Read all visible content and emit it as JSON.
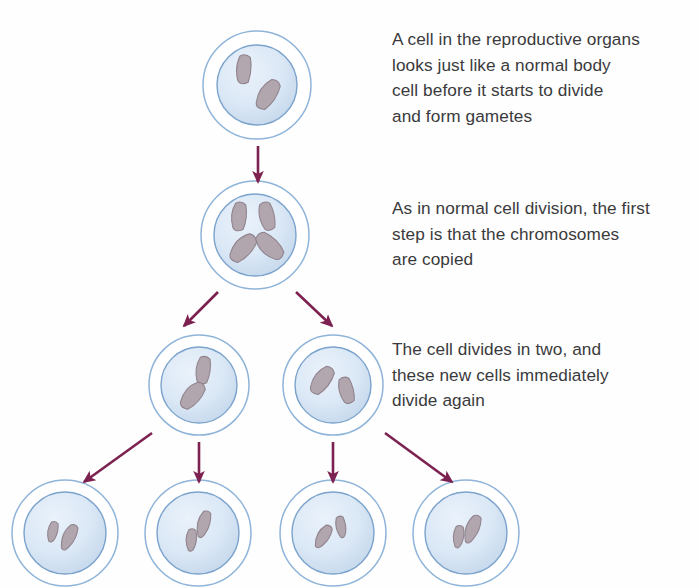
{
  "diagram": {
    "background_color": "#fefefe",
    "palette": {
      "membrane_stroke": "#8fb4d9",
      "nucleus_stroke": "#7ba3cc",
      "nucleus_fill_light": "#e2edf8",
      "nucleus_fill_dark": "#c4d8ec",
      "chromosome_fill": "#b0a3ab",
      "chromosome_stroke": "#8d7f89",
      "arrow_color": "#7c2150",
      "text_color": "#3a3a3c"
    },
    "captions": [
      {
        "id": "caption-0",
        "stage": "interphase",
        "text": "A cell in the reproductive organs\nlooks just like a normal body\ncell before it starts to divide\nand form gametes"
      },
      {
        "id": "caption-1",
        "stage": "chromosome-replication",
        "text": "As in normal cell division, the first\nstep is that the chromosomes\nare copied"
      },
      {
        "id": "caption-2",
        "stage": "two-divisions",
        "text": "The cell divides in two, and\nthese new cells immediately\ndivide again"
      }
    ],
    "rows": [
      {
        "row": 1,
        "name": "parent-cell",
        "cells": [
          {
            "id": "cell-parent",
            "cx": 257,
            "cy": 85,
            "r_outer": 54,
            "r_nucleus": 40,
            "chromosomes": 2
          }
        ]
      },
      {
        "row": 2,
        "name": "replicated-cell",
        "cells": [
          {
            "id": "cell-replicated",
            "cx": 255,
            "cy": 235,
            "r_outer": 54,
            "r_nucleus": 41,
            "chromosomes": 4
          }
        ]
      },
      {
        "row": 3,
        "name": "daughter-cells",
        "cells": [
          {
            "id": "cell-daughter-left",
            "cx": 199,
            "cy": 385,
            "r_outer": 50,
            "r_nucleus": 38,
            "chromosomes": 2
          },
          {
            "id": "cell-daughter-right",
            "cx": 333,
            "cy": 385,
            "r_outer": 50,
            "r_nucleus": 38,
            "chromosomes": 2
          }
        ]
      },
      {
        "row": 4,
        "name": "gamete-cells",
        "cells": [
          {
            "id": "cell-gamete-1",
            "cx": 65,
            "cy": 533,
            "r_outer": 53,
            "r_nucleus": 41,
            "chromosomes": 2
          },
          {
            "id": "cell-gamete-2",
            "cx": 198,
            "cy": 533,
            "r_outer": 53,
            "r_nucleus": 41,
            "chromosomes": 2
          },
          {
            "id": "cell-gamete-3",
            "cx": 333,
            "cy": 533,
            "r_outer": 53,
            "r_nucleus": 41,
            "chromosomes": 2
          },
          {
            "id": "cell-gamete-4",
            "cx": 466,
            "cy": 533,
            "r_outer": 53,
            "r_nucleus": 41,
            "chromosomes": 2
          }
        ]
      }
    ],
    "arrows": [
      {
        "id": "arrow-parent-to-replicated",
        "x1": 258,
        "y1": 146,
        "x2": 258,
        "y2": 182
      },
      {
        "id": "arrow-replicated-to-left",
        "x1": 218,
        "y1": 292,
        "x2": 184,
        "y2": 326
      },
      {
        "id": "arrow-replicated-to-right",
        "x1": 296,
        "y1": 292,
        "x2": 332,
        "y2": 326
      },
      {
        "id": "arrow-left-to-gamete-1",
        "x1": 152,
        "y1": 433,
        "x2": 84,
        "y2": 482
      },
      {
        "id": "arrow-left-to-gamete-2",
        "x1": 199,
        "y1": 442,
        "x2": 199,
        "y2": 482
      },
      {
        "id": "arrow-right-to-gamete-3",
        "x1": 333,
        "y1": 442,
        "x2": 333,
        "y2": 482
      },
      {
        "id": "arrow-right-to-gamete-4",
        "x1": 385,
        "y1": 433,
        "x2": 452,
        "y2": 482
      }
    ]
  }
}
